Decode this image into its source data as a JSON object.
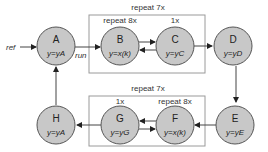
{
  "diagram": {
    "groups": {
      "top_outer": "repeat 7x",
      "top_left": "repeat 8x",
      "top_right": "1x",
      "bottom_outer": "repeat 7x",
      "bottom_left": "1x",
      "bottom_right": "repeat 8x"
    },
    "nodes": {
      "A": {
        "label": "A",
        "eq": "y=yA"
      },
      "B": {
        "label": "B",
        "eq": "y=x(k)"
      },
      "C": {
        "label": "C",
        "eq": "y=yC"
      },
      "D": {
        "label": "D",
        "eq": "y=yD"
      },
      "E": {
        "label": "E",
        "eq": "y=yE"
      },
      "F": {
        "label": "F",
        "eq": "y=x(k)"
      },
      "G": {
        "label": "G",
        "eq": "y=yG"
      },
      "H": {
        "label": "H",
        "eq": "y=yA"
      }
    },
    "edges": {
      "ref": "ref",
      "run": "run"
    }
  }
}
